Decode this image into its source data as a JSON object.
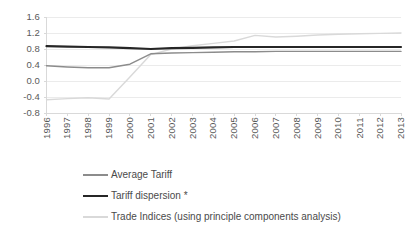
{
  "chart_data": {
    "type": "line",
    "title": "",
    "subtitle": "",
    "xlabel": "",
    "ylabel": "",
    "categories": [
      "1996",
      "1997",
      "1998",
      "1999",
      "2000",
      "2001",
      "2002",
      "2003",
      "2004",
      "2005",
      "2006",
      "2007",
      "2008",
      "2009",
      "2010",
      "2011",
      "2012",
      "2013"
    ],
    "ylim": [
      -0.8,
      1.6
    ],
    "yticks": [
      "1.6",
      "1.2",
      "0.8",
      "0.4",
      "0.0",
      "-0.4",
      "-0.8"
    ],
    "ytick_values": [
      1.6,
      1.2,
      0.8,
      0.4,
      0.0,
      -0.4,
      -0.8
    ],
    "grid": true,
    "grid_axis": "y",
    "legend_position": "bottom-left",
    "series": [
      {
        "name": "Average Tariff",
        "color": "#8c8c8c",
        "width": 1.4,
        "values": [
          0.38,
          0.35,
          0.33,
          0.33,
          0.42,
          0.68,
          0.7,
          0.71,
          0.72,
          0.73,
          0.73,
          0.74,
          0.74,
          0.74,
          0.74,
          0.74,
          0.74,
          0.74
        ]
      },
      {
        "name": "Tariff dispersion *",
        "color": "#262626",
        "width": 2.2,
        "values": [
          0.87,
          0.86,
          0.85,
          0.84,
          0.82,
          0.8,
          0.82,
          0.83,
          0.84,
          0.85,
          0.85,
          0.85,
          0.85,
          0.85,
          0.85,
          0.85,
          0.85,
          0.85
        ]
      },
      {
        "name": "Trade Indices (using principle components analysis)",
        "color": "#d9d9d9",
        "width": 1.4,
        "values": [
          -0.47,
          -0.44,
          -0.42,
          -0.45,
          0.1,
          0.66,
          0.8,
          0.88,
          0.94,
          1.0,
          1.14,
          1.1,
          1.12,
          1.15,
          1.17,
          1.18,
          1.19,
          1.2
        ]
      }
    ]
  },
  "axes": {
    "axis_color": "#d9d9d9",
    "grid_color": "#ebebeb",
    "tick_text_color": "#595959"
  },
  "legend": {
    "items": [
      {
        "label": "Average Tariff"
      },
      {
        "label": "Tariff dispersion *"
      },
      {
        "label": "Trade Indices (using principle components analysis)"
      }
    ]
  }
}
